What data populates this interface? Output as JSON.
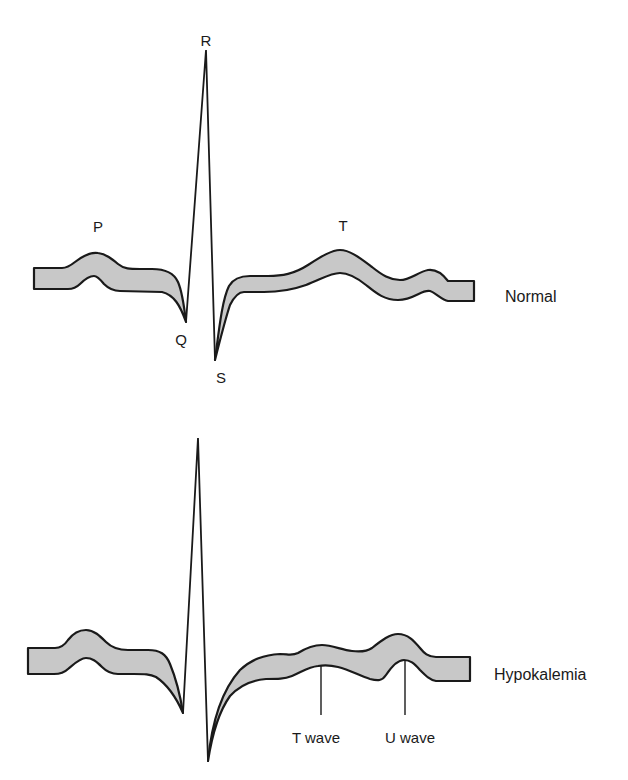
{
  "figure": {
    "colors": {
      "band_fill": "#c8c8c8",
      "stroke": "#1a1a1a",
      "background": "#ffffff"
    }
  },
  "normal": {
    "label": "Normal",
    "waves": {
      "P": "P",
      "Q": "Q",
      "R": "R",
      "S": "S",
      "T": "T"
    },
    "points": {
      "start": [
        34,
        268
      ],
      "P_peak": [
        97,
        253
      ],
      "Q": [
        186,
        322
      ],
      "R": [
        206,
        50
      ],
      "S": [
        215,
        360
      ],
      "T_peak": [
        340,
        250
      ],
      "U_peak": [
        430,
        270
      ],
      "end": [
        474,
        281
      ]
    }
  },
  "hypokalemia": {
    "label": "Hypokalemia",
    "annotations": {
      "t_wave": "T wave",
      "u_wave": "U wave"
    },
    "points": {
      "start": [
        28,
        648
      ],
      "P_peak": [
        85,
        630
      ],
      "Q": [
        183,
        713
      ],
      "R": [
        198,
        438
      ],
      "S": [
        208,
        761
      ],
      "T_peak": [
        320,
        653
      ],
      "U_peak": [
        403,
        634
      ],
      "end": [
        470,
        657
      ]
    }
  }
}
